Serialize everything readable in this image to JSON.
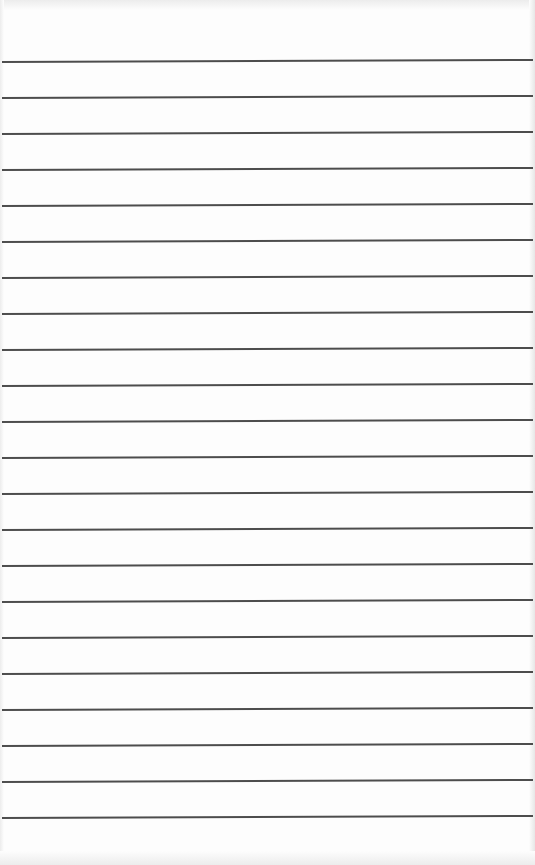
{
  "page": {
    "type": "lined-paper",
    "background_color": "#fdfdfd",
    "line_color": "#3a3a3a",
    "line_count": 22,
    "first_line_y": 62,
    "line_spacing": 36
  }
}
